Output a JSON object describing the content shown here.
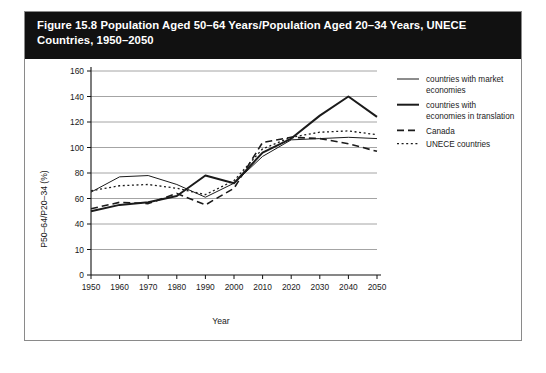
{
  "figure": {
    "title": "Figure 15.8 Population Aged 50–64 Years/Population Aged 20–34 Years, UNECE Countries, 1950–2050",
    "title_line_1": "Figure 15.8 Population Aged 50–64 Years/Population Aged 20–34 Years, UNECE",
    "title_line_2": "Countries, 1950–2050",
    "title_bar_color": "#111111",
    "title_text_color": "#ffffff",
    "border_color": "#8a8a8a",
    "background_color": "#ffffff"
  },
  "chart_data": {
    "type": "line",
    "title": "Figure 15.8 Population Aged 50–64 Years/Population Aged 20–34 Years, UNECE Countries, 1950–2050",
    "xlabel": "Year",
    "ylabel": "P50–64/P20–34 (%)",
    "x": [
      1950,
      1960,
      1970,
      1980,
      1990,
      2000,
      2010,
      2020,
      2030,
      2040,
      2050
    ],
    "xtick_labels": [
      "1950",
      "1960",
      "1970",
      "1980",
      "1990",
      "2000",
      "2010",
      "2020",
      "2030",
      "2040",
      "2050"
    ],
    "xlim": [
      1950,
      2050
    ],
    "ylim": [
      0,
      160
    ],
    "yticks": [
      0,
      20,
      40,
      60,
      80,
      100,
      120,
      140,
      160
    ],
    "ytick_labels": [
      "0",
      "10",
      "40",
      "60",
      "80",
      "100",
      "120",
      "140",
      "160"
    ],
    "grid": true,
    "grid_axis": "y",
    "legend_position": "right",
    "series": [
      {
        "name": "countries with market economies",
        "label_line_1": "countries with market",
        "label_line_2": "economies",
        "style": "solid-thin",
        "stroke_width": 1.0,
        "dash": "none",
        "color": "#1b1b1b",
        "values": [
          65,
          77,
          78,
          71,
          61,
          72,
          93,
          106,
          107,
          108,
          107
        ]
      },
      {
        "name": "countries with economies in translation",
        "label_line_1": "countries with",
        "label_line_2": "economies in translation",
        "style": "solid-thick",
        "stroke_width": 2.0,
        "dash": "none",
        "color": "#1b1b1b",
        "values": [
          50,
          55,
          57,
          62,
          78,
          72,
          96,
          107,
          125,
          140,
          124
        ]
      },
      {
        "name": "Canada",
        "label_line_1": "Canada",
        "label_line_2": "",
        "style": "dashed",
        "stroke_width": 1.6,
        "dash": "7,4",
        "color": "#1b1b1b",
        "values": [
          52,
          57,
          56,
          64,
          55,
          68,
          104,
          108,
          107,
          103,
          97
        ]
      },
      {
        "name": "UNECE countries",
        "label_line_1": "UNECE countries",
        "label_line_2": "",
        "style": "dotted",
        "stroke_width": 1.3,
        "dash": "2,2.6",
        "color": "#1b1b1b",
        "values": [
          66,
          70,
          71,
          68,
          63,
          74,
          99,
          108,
          112,
          113,
          110
        ]
      }
    ]
  }
}
